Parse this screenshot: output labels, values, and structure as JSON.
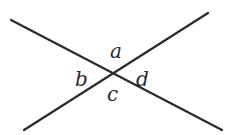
{
  "diagram": {
    "type": "intersecting-lines",
    "lines": [
      {
        "name": "line-1",
        "x1": 11,
        "y1": 20,
        "x2": 222,
        "y2": 130
      },
      {
        "name": "line-2",
        "x1": 24,
        "y1": 130,
        "x2": 208,
        "y2": 13
      }
    ],
    "angle_labels": [
      {
        "name": "a",
        "text": "a",
        "x": 110,
        "y": 58
      },
      {
        "name": "b",
        "text": "b",
        "x": 75,
        "y": 86
      },
      {
        "name": "c",
        "text": "c",
        "x": 107,
        "y": 101
      },
      {
        "name": "d",
        "text": "d",
        "x": 136,
        "y": 86
      }
    ],
    "line_color": "#2b2b2b"
  }
}
